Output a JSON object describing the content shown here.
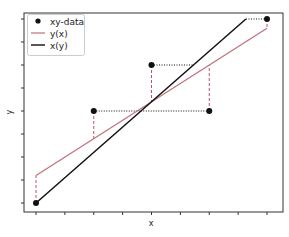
{
  "chart_data": {
    "type": "scatter",
    "title": "",
    "xlabel": "x",
    "ylabel": "y",
    "xlim": [
      -0.5,
      8.5
    ],
    "ylim": [
      -0.5,
      8.5
    ],
    "grid": false,
    "tick_labels_visible": false,
    "x_ticks": [
      0,
      1,
      2,
      3,
      4,
      5,
      6,
      7,
      8
    ],
    "y_ticks": [
      0,
      1,
      2,
      3,
      4,
      5,
      6,
      7,
      8
    ],
    "legend_position": "upper left",
    "legend": [
      {
        "label": "xy-data",
        "kind": "marker",
        "color": "#111111"
      },
      {
        "label": "y(x)",
        "kind": "line",
        "color": "#c0707a"
      },
      {
        "label": "x(y)",
        "kind": "line",
        "color": "#111111"
      }
    ],
    "series": [
      {
        "name": "xy-data",
        "type": "scatter",
        "x": [
          0,
          2,
          4,
          6,
          8
        ],
        "y": [
          0,
          4,
          6,
          4,
          8
        ],
        "color": "#111111"
      },
      {
        "name": "y(x)",
        "type": "line",
        "slope": 0.8,
        "intercept": 1.2,
        "x": [
          0,
          8
        ],
        "y": [
          1.2,
          7.6
        ],
        "color": "#c0707a"
      },
      {
        "name": "x(y)",
        "type": "line",
        "x": [
          0,
          7.27
        ],
        "y": [
          0,
          8
        ],
        "color": "#111111"
      }
    ],
    "annotations": {
      "vertical_residuals": "dashed red lines from each data point to y(x)",
      "horizontal_residuals": "dotted black lines from each data point to x(y)"
    }
  }
}
